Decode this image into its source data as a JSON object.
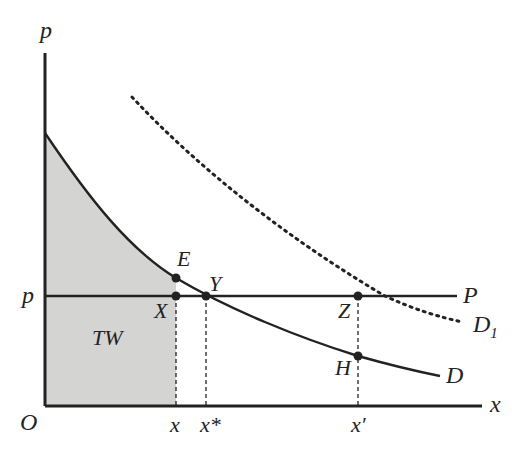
{
  "diagram": {
    "type": "economics-demand-welfare",
    "axes": {
      "y_label": "p",
      "x_label": "x",
      "origin_label": "O"
    },
    "price_line": {
      "label": "P",
      "axis_label": "p"
    },
    "curves": [
      {
        "id": "D",
        "label": "D",
        "style": "solid"
      },
      {
        "id": "D1",
        "label": "D",
        "subscript": "1",
        "style": "dotted"
      }
    ],
    "points": [
      {
        "id": "E",
        "label": "E"
      },
      {
        "id": "X",
        "label": "X"
      },
      {
        "id": "Y",
        "label": "Y"
      },
      {
        "id": "Z",
        "label": "Z"
      },
      {
        "id": "H",
        "label": "H"
      }
    ],
    "x_ticks": [
      {
        "id": "x",
        "label": "x"
      },
      {
        "id": "xstar",
        "label": "x*"
      },
      {
        "id": "xprime",
        "label": "x′"
      }
    ],
    "shaded_region": {
      "label": "TW",
      "color": "#d4d4d2"
    },
    "colors": {
      "line": "#222222",
      "shade": "#d4d4d2",
      "background": "#ffffff"
    }
  }
}
